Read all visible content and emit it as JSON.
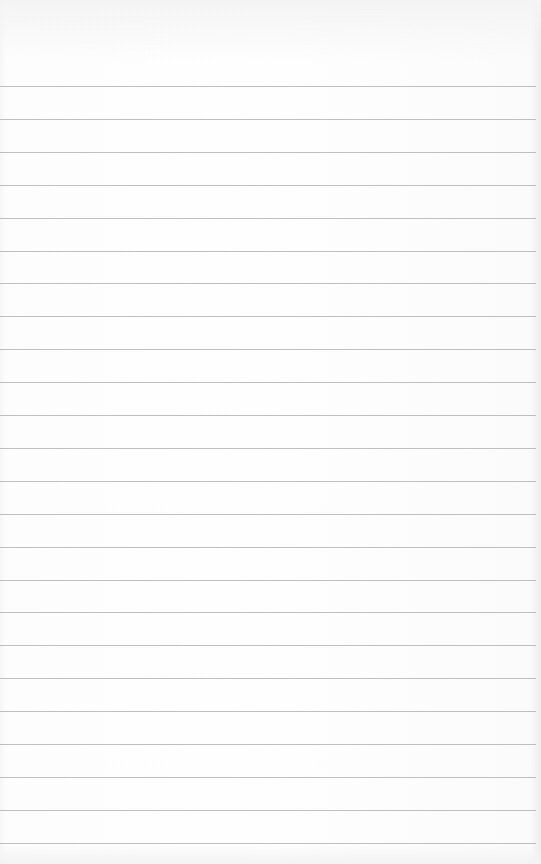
{
  "paper": {
    "type": "lined-notepad",
    "line_count": 24,
    "first_line_y": 86,
    "line_spacing": 32.9,
    "line_color": "#b4b4b4",
    "background_color": "#fcfcfc",
    "text_lines": []
  }
}
